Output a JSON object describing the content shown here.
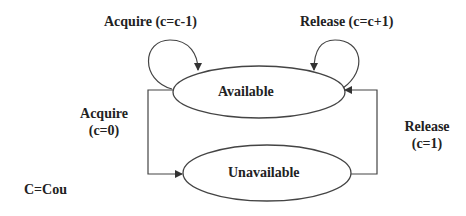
{
  "diagram": {
    "type": "state-machine",
    "states": [
      {
        "id": "available",
        "label": "Available"
      },
      {
        "id": "unavailable",
        "label": "Unavailable"
      }
    ],
    "transitions": [
      {
        "from": "available",
        "to": "available",
        "label": "Acquire (c=c-1)"
      },
      {
        "from": "available",
        "to": "available",
        "label": "Release (c=c+1)"
      },
      {
        "from": "available",
        "to": "unavailable",
        "label_line1": "Acquire",
        "label_line2": "(c=0)"
      },
      {
        "from": "unavailable",
        "to": "available",
        "label_line1": "Release",
        "label_line2": "(c=1)"
      }
    ],
    "note": "C=Cou",
    "colors": {
      "stroke": "#333333",
      "text": "#222222",
      "background": "#ffffff"
    }
  }
}
